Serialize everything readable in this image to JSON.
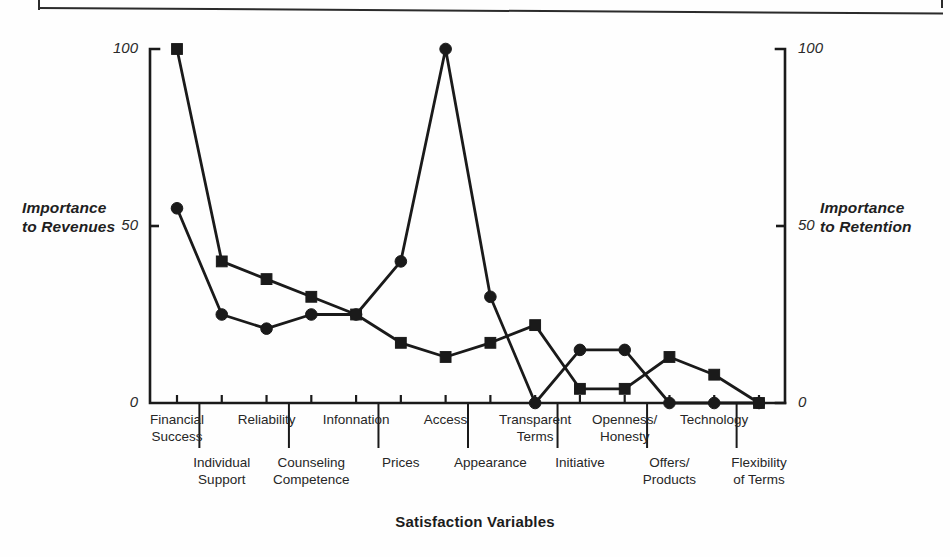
{
  "figure": {
    "background_color": "#fefefe",
    "ink_color": "#1a1a1a"
  },
  "axis_titles": {
    "left_line1": "Importance",
    "left_line2": "to Revenues",
    "right_line1": "Importance",
    "right_line2": "to Retention",
    "x_title": "Satisfaction Variables"
  },
  "ticks": {
    "left": [
      "100",
      "50",
      "0"
    ],
    "right": [
      "100",
      "50",
      "0"
    ]
  },
  "chart_data": {
    "type": "line",
    "title": "",
    "subtitle": "",
    "xlabel": "Satisfaction Variables",
    "ylabel": "Importance to Revenues",
    "y2label": "Importance to Retention",
    "ylim": [
      0,
      100
    ],
    "y2lim": [
      0,
      100
    ],
    "yticks": [
      0,
      50,
      100
    ],
    "y2ticks": [
      0,
      50,
      100
    ],
    "grid": false,
    "legend": "none",
    "categories": [
      "Financial Success",
      "Individual Support",
      "Reliability",
      "Counseling Competence",
      "Information",
      "Prices",
      "Access",
      "Appearance",
      "Transparent Terms",
      "Initiative",
      "Openness/ Honesty",
      "Offers/ Products",
      "Technology",
      "Flexibility of Terms"
    ],
    "category_rows": [
      {
        "label_line1": "Financial",
        "label_line2": "Success",
        "row": "top"
      },
      {
        "label_line1": "Individual",
        "label_line2": "Support",
        "row": "bottom"
      },
      {
        "label_line1": "Reliability",
        "label_line2": "",
        "row": "top"
      },
      {
        "label_line1": "Counseling",
        "label_line2": "Competence",
        "row": "bottom"
      },
      {
        "label_line1": "Infonnation",
        "label_line2": "",
        "row": "top"
      },
      {
        "label_line1": "Prices",
        "label_line2": "",
        "row": "bottom"
      },
      {
        "label_line1": "Access",
        "label_line2": "",
        "row": "top"
      },
      {
        "label_line1": "Appearance",
        "label_line2": "",
        "row": "bottom"
      },
      {
        "label_line1": "Transparent",
        "label_line2": "Terms",
        "row": "top"
      },
      {
        "label_line1": "Initiative",
        "label_line2": "",
        "row": "bottom"
      },
      {
        "label_line1": "Openness/",
        "label_line2": "Honesty",
        "row": "top"
      },
      {
        "label_line1": "Offers/",
        "label_line2": "Products",
        "row": "bottom"
      },
      {
        "label_line1": "Technology",
        "label_line2": "",
        "row": "top"
      },
      {
        "label_line1": "Flexibility",
        "label_line2": "of Terms",
        "row": "bottom"
      }
    ],
    "series": [
      {
        "name": "Importance to Revenues",
        "marker": "square",
        "axis": "left",
        "values": [
          100,
          40,
          35,
          30,
          25,
          17,
          13,
          17,
          22,
          4,
          4,
          13,
          8,
          0
        ]
      },
      {
        "name": "Importance to Retention",
        "marker": "circle",
        "axis": "right",
        "values": [
          55,
          25,
          21,
          25,
          25,
          40,
          100,
          30,
          0,
          15,
          15,
          0,
          0,
          0
        ]
      }
    ]
  }
}
